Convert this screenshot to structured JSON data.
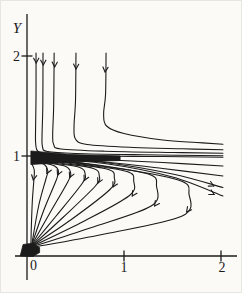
{
  "figure": {
    "background": "#fbfaf7",
    "ink": "#1b1b1b",
    "border": "#e6e6e1"
  },
  "chart_data": {
    "type": "line",
    "subtype": "phase-portrait solution curves of an ODE; equilibria near y=0 (attracting node at origin) and y=1 (saddle-like)",
    "title": "",
    "xlabel": "",
    "ylabel": "Y",
    "xlim": [
      -0.12,
      2.17
    ],
    "ylim": [
      -0.38,
      2.42
    ],
    "grid": false,
    "legend": "none",
    "x_ticks": [
      {
        "v": 1,
        "label": "1"
      },
      {
        "v": 2,
        "label": "2"
      }
    ],
    "y_ticks": [
      {
        "v": 1,
        "label": "1"
      },
      {
        "v": 2,
        "label": "2"
      }
    ],
    "origin_label": "0",
    "series": [
      {
        "name": "upper-traj-1",
        "pts": [
          [
            0.093,
            2.03
          ],
          [
            0.093,
            1.6
          ],
          [
            0.088,
            1.25
          ],
          [
            0.09,
            1.12
          ],
          [
            0.115,
            1.045
          ],
          [
            0.25,
            1.015
          ],
          [
            0.7,
            1.0
          ],
          [
            1.4,
            0.995
          ],
          [
            2.02,
            0.988
          ]
        ],
        "arrows": [
          [
            0.095,
            1.93,
            90
          ]
        ]
      },
      {
        "name": "upper-traj-2",
        "pts": [
          [
            0.165,
            2.03
          ],
          [
            0.163,
            1.5
          ],
          [
            0.155,
            1.2
          ],
          [
            0.16,
            1.09
          ],
          [
            0.21,
            1.045
          ],
          [
            0.5,
            1.025
          ],
          [
            1.2,
            1.012
          ],
          [
            2.02,
            1.002
          ]
        ],
        "arrows": [
          [
            0.168,
            1.91,
            90
          ]
        ]
      },
      {
        "name": "upper-traj-3",
        "pts": [
          [
            0.28,
            2.03
          ],
          [
            0.275,
            1.5
          ],
          [
            0.265,
            1.22
          ],
          [
            0.275,
            1.115
          ],
          [
            0.35,
            1.07
          ],
          [
            0.8,
            1.048
          ],
          [
            1.5,
            1.035
          ],
          [
            2.02,
            1.028
          ]
        ],
        "arrows": [
          [
            0.285,
            1.89,
            91
          ]
        ]
      },
      {
        "name": "upper-traj-4",
        "pts": [
          [
            0.505,
            2.03
          ],
          [
            0.5,
            1.55
          ],
          [
            0.485,
            1.3
          ],
          [
            0.5,
            1.17
          ],
          [
            0.62,
            1.115
          ],
          [
            1.1,
            1.085
          ],
          [
            1.6,
            1.072
          ],
          [
            2.02,
            1.062
          ]
        ],
        "arrows": [
          [
            0.505,
            1.87,
            92
          ]
        ]
      },
      {
        "name": "upper-traj-5",
        "pts": [
          [
            0.815,
            2.03
          ],
          [
            0.81,
            1.62
          ],
          [
            0.79,
            1.42
          ],
          [
            0.82,
            1.3
          ],
          [
            1.0,
            1.225
          ],
          [
            1.4,
            1.16
          ],
          [
            1.75,
            1.135
          ],
          [
            2.02,
            1.118
          ]
        ],
        "arrows": [
          [
            0.805,
            1.84,
            95
          ]
        ]
      },
      {
        "name": "lower-traj-0-axis",
        "pts": [
          [
            0.045,
            0.93
          ],
          [
            0.075,
            0.86
          ],
          [
            0.07,
            0.75
          ],
          [
            0.055,
            0.55
          ],
          [
            0.045,
            0.3
          ],
          [
            0.04,
            0.1
          ]
        ],
        "arrows": [
          [
            0.065,
            0.76,
            100
          ]
        ]
      },
      {
        "name": "lower-traj-1",
        "pts": [
          [
            0.05,
            0.945
          ],
          [
            0.12,
            0.935
          ],
          [
            0.185,
            0.91
          ],
          [
            0.215,
            0.85
          ],
          [
            0.195,
            0.77
          ],
          [
            0.12,
            0.5
          ],
          [
            0.05,
            0.12
          ]
        ],
        "arrows": [
          [
            0.205,
            0.825,
            115
          ]
        ]
      },
      {
        "name": "lower-traj-2",
        "pts": [
          [
            0.05,
            0.95
          ],
          [
            0.17,
            0.93
          ],
          [
            0.285,
            0.9
          ],
          [
            0.325,
            0.845
          ],
          [
            0.3,
            0.755
          ],
          [
            0.17,
            0.45
          ],
          [
            0.05,
            0.115
          ]
        ],
        "arrows": [
          [
            0.315,
            0.81,
            114
          ]
        ]
      },
      {
        "name": "lower-traj-3",
        "pts": [
          [
            0.05,
            0.955
          ],
          [
            0.22,
            0.93
          ],
          [
            0.4,
            0.895
          ],
          [
            0.45,
            0.83
          ],
          [
            0.42,
            0.74
          ],
          [
            0.23,
            0.42
          ],
          [
            0.05,
            0.11
          ]
        ],
        "arrows": [
          [
            0.44,
            0.785,
            114
          ]
        ]
      },
      {
        "name": "lower-traj-4",
        "pts": [
          [
            0.05,
            0.96
          ],
          [
            0.3,
            0.925
          ],
          [
            0.545,
            0.885
          ],
          [
            0.6,
            0.815
          ],
          [
            0.565,
            0.72
          ],
          [
            0.3,
            0.4
          ],
          [
            0.05,
            0.105
          ]
        ],
        "arrows": [
          [
            0.59,
            0.755,
            116
          ]
        ]
      },
      {
        "name": "lower-traj-5",
        "pts": [
          [
            0.05,
            0.965
          ],
          [
            0.37,
            0.925
          ],
          [
            0.685,
            0.875
          ],
          [
            0.745,
            0.8
          ],
          [
            0.705,
            0.7
          ],
          [
            0.37,
            0.385
          ],
          [
            0.05,
            0.1
          ]
        ],
        "arrows": [
          [
            0.73,
            0.73,
            117
          ]
        ]
      },
      {
        "name": "lower-traj-6",
        "pts": [
          [
            0.05,
            0.97
          ],
          [
            0.45,
            0.925
          ],
          [
            0.84,
            0.865
          ],
          [
            0.9,
            0.785
          ],
          [
            0.855,
            0.665
          ],
          [
            0.45,
            0.36
          ],
          [
            0.05,
            0.1
          ]
        ],
        "arrows": [
          [
            0.885,
            0.69,
            119
          ]
        ]
      },
      {
        "name": "lower-traj-7",
        "pts": [
          [
            0.05,
            0.975
          ],
          [
            0.55,
            0.92
          ],
          [
            1.03,
            0.845
          ],
          [
            1.1,
            0.75
          ],
          [
            1.05,
            0.6
          ],
          [
            0.55,
            0.33
          ],
          [
            0.05,
            0.095
          ]
        ],
        "arrows": [
          [
            1.085,
            0.6,
            122
          ]
        ]
      },
      {
        "name": "lower-traj-8",
        "pts": [
          [
            0.05,
            0.98
          ],
          [
            0.65,
            0.915
          ],
          [
            1.25,
            0.82
          ],
          [
            1.335,
            0.7
          ],
          [
            1.28,
            0.5
          ],
          [
            0.65,
            0.28
          ],
          [
            0.05,
            0.09
          ]
        ],
        "arrows": [
          [
            1.315,
            0.5,
            126
          ]
        ]
      },
      {
        "name": "lower-traj-9",
        "pts": [
          [
            0.05,
            0.985
          ],
          [
            0.8,
            0.9
          ],
          [
            1.56,
            0.76
          ],
          [
            1.67,
            0.62
          ],
          [
            1.6,
            0.4
          ],
          [
            0.8,
            0.22
          ],
          [
            0.05,
            0.085
          ]
        ],
        "arrows": [
          [
            1.645,
            0.44,
            128
          ]
        ]
      },
      {
        "name": "lower-branch-clipped-a",
        "pts": [
          [
            0.05,
            1.0
          ],
          [
            0.7,
            0.968
          ],
          [
            1.4,
            0.935
          ],
          [
            2.02,
            0.9
          ]
        ],
        "arrows": []
      },
      {
        "name": "lower-branch-clipped-b",
        "pts": [
          [
            0.05,
            0.995
          ],
          [
            0.7,
            0.95
          ],
          [
            1.4,
            0.875
          ],
          [
            2.02,
            0.8
          ]
        ],
        "arrows": []
      },
      {
        "name": "lower-branch-clipped-c",
        "pts": [
          [
            0.05,
            0.99
          ],
          [
            0.8,
            0.935
          ],
          [
            1.5,
            0.82
          ],
          [
            2.02,
            0.685
          ]
        ],
        "arrows": [
          [
            1.925,
            0.7,
            27
          ]
        ]
      },
      {
        "name": "lower-branch-clipped-d",
        "pts": [
          [
            0.05,
            0.985
          ],
          [
            0.8,
            0.925
          ],
          [
            1.5,
            0.79
          ],
          [
            2.02,
            0.6
          ]
        ],
        "arrows": [
          [
            1.93,
            0.615,
            28
          ]
        ]
      }
    ],
    "filled_regions": [
      {
        "name": "converging-bundle-wedge",
        "pts": [
          [
            0.04,
            1.05
          ],
          [
            0.45,
            1.015
          ],
          [
            0.96,
            1.0
          ],
          [
            0.96,
            0.955
          ],
          [
            0.45,
            0.94
          ],
          [
            0.04,
            0.915
          ]
        ]
      },
      {
        "name": "origin-node-blob",
        "pts": [
          [
            -0.07,
            0.0
          ],
          [
            -0.04,
            0.115
          ],
          [
            0.04,
            0.125
          ],
          [
            0.13,
            0.085
          ],
          [
            0.13,
            0.035
          ],
          [
            0.06,
            -0.005
          ]
        ]
      }
    ],
    "layout": {
      "canvas_px": [
        242,
        293
      ],
      "origin_px": [
        26,
        255
      ],
      "px_per_unit_x": 97,
      "px_per_unit_y": 100,
      "y_axis_px": {
        "top": 13,
        "bottom": 279
      },
      "x_axis_px": {
        "left": 14,
        "right": 236
      },
      "y_tick_half_px": 5.5,
      "x_tick_half_px": 5.5,
      "labels": {
        "ylabel_px": [
          16,
          32
        ],
        "ytick2_px": [
          19,
          60
        ],
        "ytick1_px": [
          19,
          160
        ],
        "xtick1_px": [
          123,
          271
        ],
        "xtick2_px": [
          221,
          271
        ],
        "origin_px": [
          29,
          269
        ]
      },
      "stroke": {
        "axis_w": 1.3,
        "curve_w": 1.1,
        "arrow_w": 1.1,
        "arrow_size": 5.5
      },
      "font": {
        "tick_size": 14,
        "ylabel_size": 15
      }
    }
  }
}
